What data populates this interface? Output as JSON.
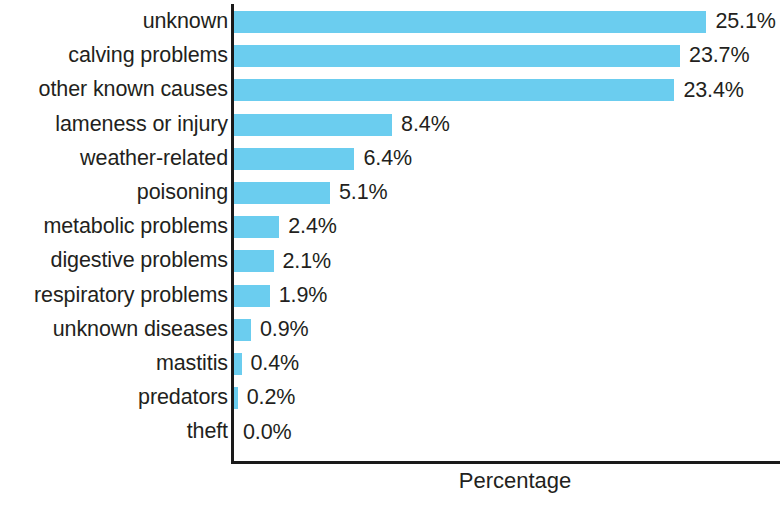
{
  "chart_data": {
    "type": "bar",
    "orientation": "horizontal",
    "title": "",
    "xlabel": "Percentage",
    "ylabel": "",
    "xlim": [
      0,
      29
    ],
    "grid": false,
    "legend": false,
    "bar_color": "#6bcdef",
    "axis_color": "#1a1a1a",
    "background_color": "#ffffff",
    "value_suffix": "%",
    "categories": [
      "unknown",
      "calving problems",
      "other known causes",
      "lameness or injury",
      "weather-related",
      "poisoning",
      "metabolic problems",
      "digestive problems",
      "respiratory problems",
      "unknown diseases",
      "mastitis",
      "predators",
      "theft"
    ],
    "values": [
      25.1,
      23.7,
      23.4,
      8.4,
      6.4,
      5.1,
      2.4,
      2.1,
      1.9,
      0.9,
      0.4,
      0.2,
      0.0
    ],
    "value_labels": [
      "25.1%",
      "23.7%",
      "23.4%",
      "8.4%",
      "6.4%",
      "5.1%",
      "2.4%",
      "2.1%",
      "1.9%",
      "0.9%",
      "0.4%",
      "0.2%",
      "0.0%"
    ]
  },
  "axis": {
    "x_title": "Percentage"
  }
}
